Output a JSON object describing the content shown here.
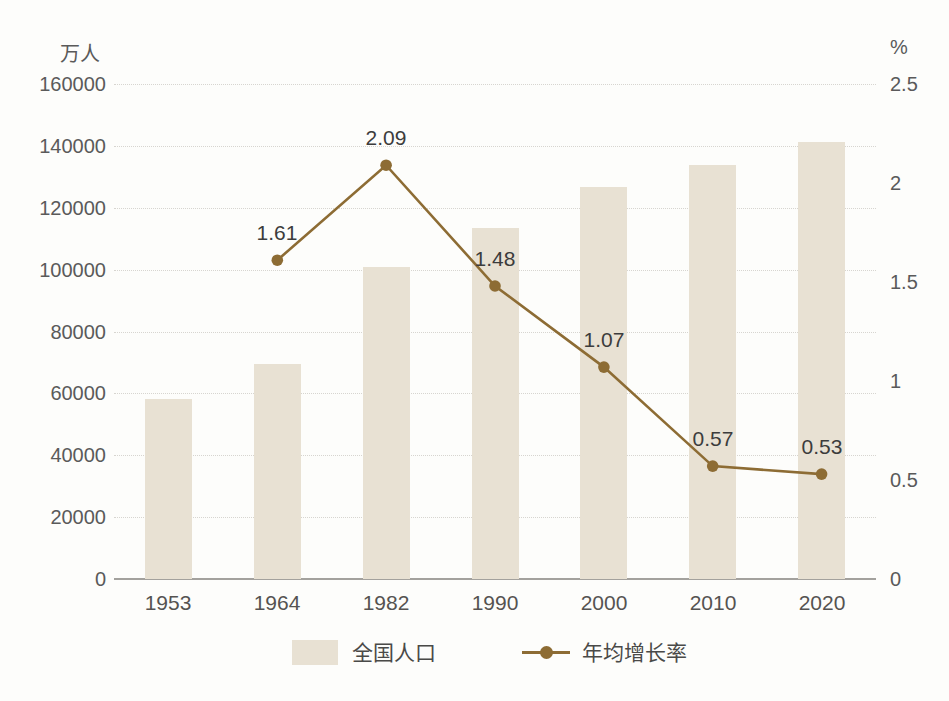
{
  "chart_data": {
    "type": "bar",
    "subtype": "combo-bar-line-dual-axis",
    "categories": [
      "1953",
      "1964",
      "1982",
      "1990",
      "2000",
      "2010",
      "2020"
    ],
    "series": [
      {
        "name": "全国人口",
        "type": "bar",
        "axis": "left",
        "unit": "万人",
        "values": [
          58260,
          69458,
          100818,
          113368,
          126583,
          133972,
          141178
        ]
      },
      {
        "name": "年均增长率",
        "type": "line",
        "axis": "right",
        "unit": "%",
        "values": [
          null,
          1.61,
          2.09,
          1.48,
          1.07,
          0.57,
          0.53
        ],
        "point_labels": [
          "",
          "1.61",
          "2.09",
          "1.48",
          "1.07",
          "0.57",
          "0.53"
        ]
      }
    ],
    "left_axis": {
      "title": "万人",
      "min": 0,
      "max": 160000,
      "step": 20000,
      "tick_labels": [
        "0",
        "20000",
        "40000",
        "60000",
        "80000",
        "100000",
        "120000",
        "140000",
        "160000"
      ]
    },
    "right_axis": {
      "title": "%",
      "min": 0,
      "max": 2.5,
      "step": 0.5,
      "tick_labels": [
        "0",
        "0.5",
        "1",
        "1.5",
        "2",
        "2.5"
      ]
    },
    "grid": "horizontal-dotted",
    "legend_position": "bottom-center",
    "colors": {
      "bar_fill": "#e8e1d3",
      "line": "#8d6c34",
      "gridline": "#d7d5d0",
      "baseline": "#a3a19d",
      "tick_text": "#5a5a5a",
      "point_label_text": "#3c3c3c",
      "background": "#fdfdfb"
    }
  }
}
